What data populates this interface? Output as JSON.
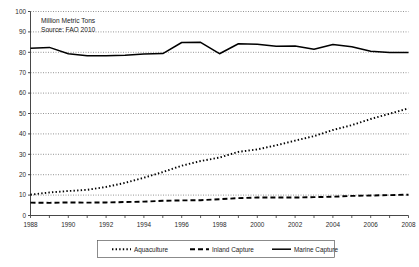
{
  "chart_data": {
    "type": "line",
    "title": "",
    "annotations": [
      {
        "name": "units-note",
        "text": "Million Metric Tons"
      },
      {
        "name": "source-note",
        "text": "Source:  FAO 2010"
      }
    ],
    "xlabel": "",
    "ylabel": "",
    "xlim": [
      1988,
      2008
    ],
    "ylim": [
      0,
      100
    ],
    "grid": true,
    "grid_axis": "y",
    "legend_position": "bottom",
    "y_ticks": [
      0,
      10,
      20,
      30,
      40,
      50,
      60,
      70,
      80,
      90,
      100
    ],
    "x_ticks": [
      1988,
      1990,
      1992,
      1994,
      1996,
      1998,
      2000,
      2002,
      2004,
      2006,
      2008
    ],
    "x": [
      1988,
      1989,
      1990,
      1991,
      1992,
      1993,
      1994,
      1995,
      1996,
      1997,
      1998,
      1999,
      2000,
      2001,
      2002,
      2003,
      2004,
      2005,
      2006,
      2007,
      2008
    ],
    "series": [
      {
        "name": "Aquaculture",
        "style": "dotted",
        "color": "#000000",
        "values": [
          10.2,
          11.3,
          12.0,
          12.6,
          14.0,
          16.0,
          18.5,
          21.3,
          24.4,
          26.7,
          28.4,
          31.2,
          32.4,
          34.4,
          36.7,
          38.9,
          41.9,
          44.3,
          47.3,
          49.9,
          52.5
        ]
      },
      {
        "name": "Inland Capture",
        "style": "dashed",
        "color": "#000000",
        "values": [
          6.3,
          6.2,
          6.4,
          6.3,
          6.4,
          6.6,
          6.8,
          7.2,
          7.4,
          7.5,
          8.0,
          8.5,
          8.8,
          8.8,
          8.8,
          9.0,
          9.2,
          9.6,
          9.8,
          10.0,
          10.2
        ]
      },
      {
        "name": "Marine Capture",
        "style": "solid",
        "color": "#000000",
        "values": [
          82.0,
          82.4,
          79.3,
          78.3,
          78.3,
          78.5,
          79.2,
          79.4,
          84.8,
          84.9,
          79.3,
          84.2,
          84.0,
          83.0,
          83.1,
          81.5,
          83.8,
          82.7,
          80.5,
          79.9,
          79.9
        ]
      }
    ]
  },
  "legend": {
    "items": [
      {
        "label": "Aquaculture",
        "style": "dotted"
      },
      {
        "label": "Inland Capture",
        "style": "dashed"
      },
      {
        "label": "Marine Capture",
        "style": "solid"
      }
    ]
  }
}
